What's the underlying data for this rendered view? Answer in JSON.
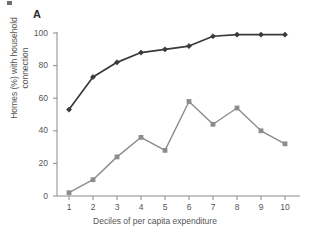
{
  "figure": {
    "panel_label": "A",
    "crop_artifact": "crop-mark"
  },
  "chart_data": {
    "type": "line",
    "title": "",
    "panel": "A",
    "xlabel": "Deciles of per capita expenditure",
    "ylabel": "Homes (%) with household connection",
    "ylabel_line1": "Homes (%) with household",
    "ylabel_line2": "connection",
    "categories": [
      "1",
      "2",
      "3",
      "4",
      "5",
      "6",
      "7",
      "8",
      "9",
      "10"
    ],
    "x": [
      1,
      2,
      3,
      4,
      5,
      6,
      7,
      8,
      9,
      10
    ],
    "xlim": [
      0.5,
      10.5
    ],
    "ylim": [
      0,
      100
    ],
    "yticks": [
      0,
      20,
      40,
      60,
      80,
      100
    ],
    "ytick_labels": [
      "0",
      "20",
      "40",
      "60",
      "80",
      "100"
    ],
    "xticks": [
      1,
      2,
      3,
      4,
      5,
      6,
      7,
      8,
      9,
      10
    ],
    "xtick_labels": [
      "1",
      "2",
      "3",
      "4",
      "5",
      "6",
      "7",
      "8",
      "9",
      "10"
    ],
    "grid": false,
    "legend": "none",
    "series": [
      {
        "name": "dark-series",
        "marker": "diamond",
        "color": "#3a3a3a",
        "values": [
          53,
          73,
          82,
          88,
          90,
          92,
          98,
          99,
          99,
          99
        ]
      },
      {
        "name": "grey-series",
        "marker": "square",
        "color": "#8c8c8c",
        "values": [
          2,
          10,
          24,
          36,
          28,
          58,
          44,
          54,
          40,
          32
        ]
      }
    ]
  },
  "colors": {
    "dark_series": "#3a3a3a",
    "grey_series": "#8c8c8c",
    "axis": "#8a8a8a",
    "text": "#555555",
    "background": "#ffffff"
  }
}
